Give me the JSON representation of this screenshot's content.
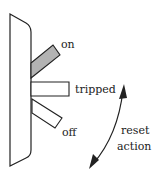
{
  "diagram": {
    "positions": [
      {
        "label": "on",
        "fill": "#b3b3b3"
      },
      {
        "label": "tripped",
        "fill": "#ffffff"
      },
      {
        "label": "off",
        "fill": "#ffffff"
      }
    ],
    "arrow": {
      "label_line1": "reset",
      "label_line2": "action"
    },
    "colors": {
      "stroke": "#222222",
      "on_lever": "#b3b3b3",
      "background": "#ffffff"
    }
  }
}
